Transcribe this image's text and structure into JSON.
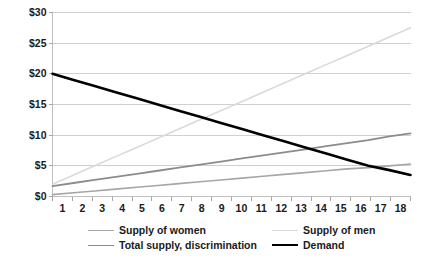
{
  "chart_data": {
    "type": "line",
    "title": "",
    "xlabel": "",
    "ylabel": "",
    "xlim": [
      1,
      18
    ],
    "ylim": [
      0,
      30
    ],
    "grid": true,
    "grid_axis": "y",
    "legend_position": "bottom",
    "x": [
      1,
      2,
      3,
      4,
      5,
      6,
      7,
      8,
      9,
      10,
      11,
      12,
      13,
      14,
      15,
      16,
      17,
      18
    ],
    "xtick_labels": [
      "1",
      "2",
      "3",
      "4",
      "5",
      "6",
      "7",
      "8",
      "9",
      "10",
      "11",
      "12",
      "13",
      "14",
      "15",
      "16",
      "17",
      "18"
    ],
    "ytick_labels": [
      "$0",
      "$5",
      "$10",
      "$15",
      "$20",
      "$25",
      "$30"
    ],
    "ytick_values": [
      0,
      5,
      10,
      15,
      20,
      25,
      30
    ],
    "series": [
      {
        "name": "Supply of women",
        "color": "#a6a6a6",
        "width": 1.6,
        "values": [
          0.3,
          0.6,
          0.9,
          1.2,
          1.5,
          1.8,
          2.1,
          2.4,
          2.7,
          3.0,
          3.3,
          3.6,
          3.9,
          4.2,
          4.5,
          4.7,
          5.0,
          5.3
        ]
      },
      {
        "name": "Supply of men",
        "color": "#d9d9d9",
        "width": 1.6,
        "values": [
          2.0,
          3.5,
          5.0,
          6.5,
          8.0,
          9.5,
          11.0,
          12.5,
          14.0,
          15.5,
          17.0,
          18.5,
          20.0,
          21.5,
          23.0,
          24.5,
          26.0,
          27.5
        ]
      },
      {
        "name": "Total supply, discrimination",
        "color": "#8c8c8c",
        "width": 1.8,
        "values": [
          1.7,
          2.2,
          2.7,
          3.2,
          3.7,
          4.2,
          4.7,
          5.2,
          5.7,
          6.2,
          6.7,
          7.2,
          7.7,
          8.2,
          8.7,
          9.2,
          9.8,
          10.3
        ]
      },
      {
        "name": "Demand",
        "color": "#000000",
        "width": 2.6,
        "values": [
          20.0,
          19.0,
          18.0,
          17.0,
          16.0,
          15.0,
          14.0,
          13.0,
          12.0,
          11.0,
          10.0,
          9.0,
          8.0,
          7.0,
          6.0,
          5.0,
          4.3,
          3.5
        ]
      }
    ]
  },
  "legend": {
    "entries": [
      {
        "label": "Supply of women",
        "color": "#a6a6a6",
        "width": 1.6
      },
      {
        "label": "Supply of men",
        "color": "#d9d9d9",
        "width": 1.6
      },
      {
        "label": "Total supply, discrimination",
        "color": "#8c8c8c",
        "width": 1.8
      },
      {
        "label": "Demand",
        "color": "#000000",
        "width": 2.6
      }
    ]
  },
  "style": {
    "plot_background": "#ffffff",
    "gridline_color": "#d0d0d0",
    "axis_color": "#bfbfbf",
    "tick_color": "#a6a6a6",
    "text_color": "#1a1a1a"
  }
}
